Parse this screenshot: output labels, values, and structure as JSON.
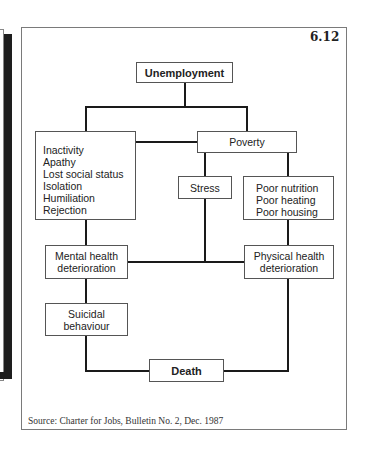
{
  "figure": {
    "number": "6.12",
    "source": "Source: Charter for Jobs, Bulletin No. 2, Dec. 1987"
  },
  "nodes": {
    "unemployment": "Unemployment",
    "social_effects": [
      "Inactivity",
      "Apathy",
      "Lost social status",
      "Isolation",
      "Humiliation",
      "Rejection"
    ],
    "poverty": "Poverty",
    "stress": "Stress",
    "material_effects": [
      "Poor nutrition",
      "Poor heating",
      "Poor housing"
    ],
    "mental_health": [
      "Mental health",
      "deterioration"
    ],
    "physical_health": [
      "Physical health",
      "deterioration"
    ],
    "suicidal": [
      "Suicidal",
      "behaviour"
    ],
    "death": "Death"
  },
  "edges": [
    [
      "Unemployment",
      "Social effects"
    ],
    [
      "Unemployment",
      "Poverty"
    ],
    [
      "Social effects",
      "Poverty"
    ],
    [
      "Social effects",
      "Mental health deterioration"
    ],
    [
      "Poverty",
      "Stress"
    ],
    [
      "Poverty",
      "Poor nutrition/heating/housing"
    ],
    [
      "Stress",
      "Mental health / Physical health link"
    ],
    [
      "Poor nutrition/heating/housing",
      "Physical health deterioration"
    ],
    [
      "Mental health deterioration",
      "Physical health deterioration"
    ],
    [
      "Mental health deterioration",
      "Suicidal behaviour"
    ],
    [
      "Suicidal behaviour",
      "Death"
    ],
    [
      "Physical health deterioration",
      "Death"
    ]
  ]
}
